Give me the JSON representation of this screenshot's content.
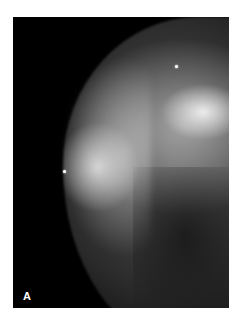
{
  "figure": {
    "panel_label": "A",
    "markers": [
      {
        "name": "skin-marker-upper",
        "x": 163,
        "y": 50
      },
      {
        "name": "skin-marker-nipple",
        "x": 51,
        "y": 155
      }
    ],
    "colors": {
      "background": "#000000",
      "frame_border": "#ffffff"
    }
  }
}
